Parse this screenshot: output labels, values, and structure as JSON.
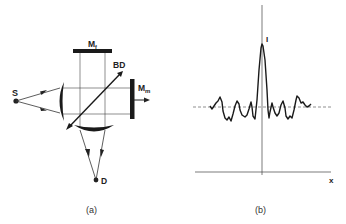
{
  "panel_a": {
    "caption": "(a)",
    "labels": {
      "source": "S",
      "fixed_mirror": "M",
      "fixed_mirror_sub": "f",
      "beamsplitter": "BD",
      "moving_mirror": "M",
      "moving_mirror_sub": "m",
      "detector": "D"
    }
  },
  "panel_b": {
    "caption": "(b)",
    "y_label": "I",
    "x_label": "x"
  },
  "colors": {
    "ink": "#222222",
    "background": "#ffffff"
  }
}
